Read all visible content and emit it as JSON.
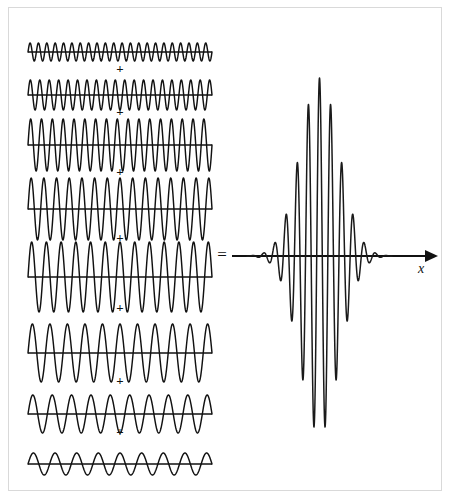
{
  "figure": {
    "background_color": "#ffffff",
    "border_color": "#d9d9d9",
    "stroke_color": "#111111"
  },
  "operators": {
    "plus_label": "+",
    "equals_label": "="
  },
  "axis": {
    "x_label": "x",
    "arrow_name": "x-axis-arrow"
  },
  "chart_data": {
    "type": "line",
    "xlabel": "x",
    "ylabel": "",
    "grid": false,
    "legend": "none",
    "x_domain": [
      0,
      1
    ],
    "components": [
      {
        "index": 1,
        "cycles": 22.0,
        "amplitude": 0.22,
        "phase": 0.0,
        "row_label": "component-1"
      },
      {
        "index": 2,
        "cycles": 19.5,
        "amplitude": 0.4,
        "phase": 0.0,
        "row_label": "component-2"
      },
      {
        "index": 3,
        "cycles": 17.0,
        "amplitude": 0.72,
        "phase": 0.0,
        "row_label": "component-3"
      },
      {
        "index": 4,
        "cycles": 14.5,
        "amplitude": 0.9,
        "phase": 0.0,
        "row_label": "component-4"
      },
      {
        "index": 5,
        "cycles": 12.5,
        "amplitude": 1.0,
        "phase": 0.0,
        "row_label": "component-5"
      },
      {
        "index": 6,
        "cycles": 10.5,
        "amplitude": 0.8,
        "phase": 0.0,
        "row_label": "component-6"
      },
      {
        "index": 7,
        "cycles": 9.5,
        "amplitude": 0.48,
        "phase": 0.0,
        "row_label": "component-7"
      },
      {
        "index": 8,
        "cycles": 8.5,
        "amplitude": 0.26,
        "phase": 0.0,
        "row_label": "component-8"
      }
    ],
    "result": {
      "name": "wave-packet",
      "carrier_cycles": 13.0,
      "envelope": "gaussian",
      "envelope_center": 0.5,
      "envelope_width": 0.135,
      "peak_amplitude": 1.0,
      "baseline_is_x_axis": true
    }
  },
  "layout": {
    "left_column_x_start": 28,
    "left_column_x_end": 212,
    "rows": [
      {
        "baseline_y": 52,
        "half_height": 9,
        "plus_y": 73
      },
      {
        "baseline_y": 95,
        "half_height": 15,
        "plus_y": 116
      },
      {
        "baseline_y": 145,
        "half_height": 26,
        "plus_y": 176
      },
      {
        "baseline_y": 209,
        "half_height": 31,
        "plus_y": 242
      },
      {
        "baseline_y": 277,
        "half_height": 35,
        "plus_y": 312
      },
      {
        "baseline_y": 353,
        "half_height": 29,
        "plus_y": 385
      },
      {
        "baseline_y": 414,
        "half_height": 19,
        "plus_y": 436
      },
      {
        "baseline_y": 464,
        "half_height": 11,
        "plus_y": null
      }
    ],
    "equals_x": 222,
    "equals_y": 260,
    "packet_axis_y": 256,
    "packet_axis_x_start": 232,
    "packet_axis_x_end": 432,
    "packet_x_start": 247,
    "packet_x_end": 392,
    "x_label_x": 421,
    "x_label_y": 273
  }
}
